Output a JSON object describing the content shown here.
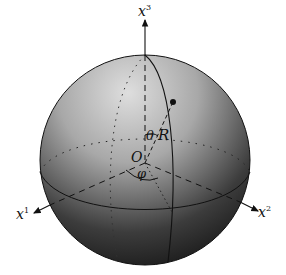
{
  "diagram": {
    "type": "sphere-spherical-coordinates",
    "colors": {
      "background": "#ffffff",
      "sphere_light": "#d4d4d4",
      "sphere_mid": "#8a8a8a",
      "sphere_dark": "#151515",
      "lines": "#111111"
    },
    "labels": {
      "axis_x3": {
        "base": "x",
        "sup": "3"
      },
      "axis_x1": {
        "base": "x",
        "sup": "1"
      },
      "axis_x2": {
        "base": "x",
        "sup": "2"
      },
      "origin": "O",
      "theta": "θ",
      "radius": "R",
      "phi": "φ"
    }
  }
}
